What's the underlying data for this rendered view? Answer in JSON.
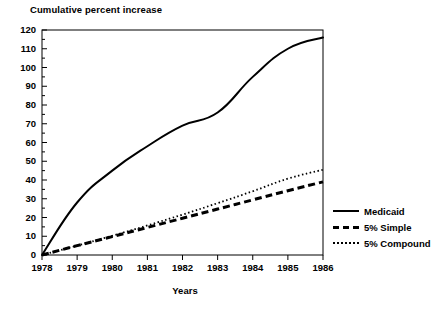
{
  "chart_data": {
    "type": "line",
    "title": "Cumulative percent increase",
    "xlabel": "Years",
    "ylabel": "",
    "x": [
      1978,
      1979,
      1980,
      1981,
      1982,
      1983,
      1984,
      1985,
      1986
    ],
    "xtick_labels": [
      "1978",
      "1979",
      "1980",
      "1981",
      "1982",
      "1983",
      "1984",
      "1985",
      "1986"
    ],
    "ytick_labels": [
      "0",
      "10",
      "20",
      "30",
      "40",
      "50",
      "60",
      "70",
      "80",
      "90",
      "100",
      "110",
      "120"
    ],
    "ytick_values": [
      0,
      10,
      20,
      30,
      40,
      50,
      60,
      70,
      80,
      90,
      100,
      110,
      120
    ],
    "xlim": [
      1978,
      1986
    ],
    "ylim": [
      0,
      120
    ],
    "grid": false,
    "minor_ticks_y": true,
    "legend_position": "outside-right-bottom",
    "series": [
      {
        "name": "5% Compound",
        "style": "dotted",
        "color": "#000000",
        "values": [
          0,
          5,
          10.25,
          15.76,
          21.55,
          27.63,
          34.01,
          40.71,
          45.5
        ]
      },
      {
        "name": "5% Simple",
        "style": "dashed",
        "color": "#000000",
        "values": [
          0,
          5,
          9.8,
          14.7,
          19.6,
          24.5,
          29.4,
          34.3,
          39
        ]
      },
      {
        "name": "Medicaid",
        "style": "solid",
        "color": "#000000",
        "values": [
          0,
          28,
          45,
          58,
          69,
          76,
          95,
          110,
          116
        ]
      }
    ]
  }
}
